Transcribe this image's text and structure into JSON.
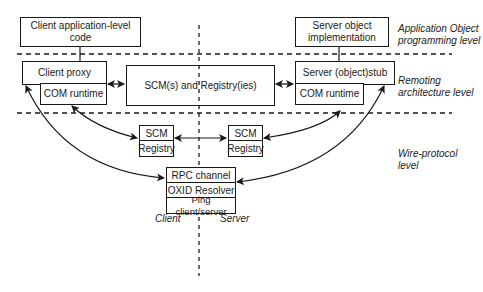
{
  "diagram": {
    "levels": {
      "application": "Application Object programming level",
      "application_line1": "Application Object",
      "application_line2": "programming level",
      "remoting_line1": "Remoting",
      "remoting_line2": "architecture level",
      "wire_line1": "Wire-protocol",
      "wire_line2": "level"
    },
    "boxes": {
      "client_app": "Client application-level code",
      "server_impl_line1": "Server object",
      "server_impl_line2": "implementation",
      "client_proxy": "Client proxy",
      "client_com_runtime": "COM runtime",
      "scm_registries": "SCM(s) and Registry(ies)",
      "server_stub": "Server (object)stub",
      "server_com_runtime": "COM runtime",
      "left_scm": "SCM",
      "left_registry": "Registry",
      "right_scm": "SCM",
      "right_registry": "Registry",
      "rpc_channel": "RPC channel",
      "oxid_resolver": "OXID Resolver",
      "ping": "Ping client/server"
    },
    "sides": {
      "client": "Client",
      "server": "Server"
    }
  }
}
